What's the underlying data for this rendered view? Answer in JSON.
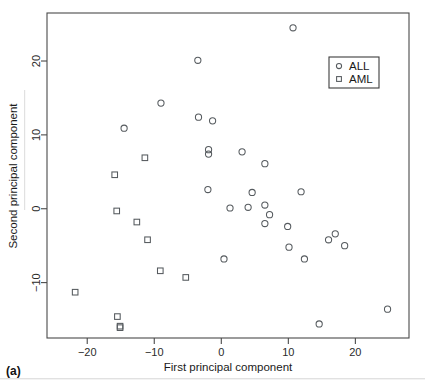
{
  "figure": {
    "panel_label": "(a)",
    "background_color": "#ffffff",
    "point_color": "#555a5e",
    "axis_color": "#4a4a4a"
  },
  "legend": {
    "position": "top-right",
    "entries": [
      {
        "label": "ALL",
        "marker": "circle-icon"
      },
      {
        "label": "AML",
        "marker": "square-icon"
      }
    ]
  },
  "chart_data": {
    "type": "scatter",
    "title": "",
    "subtitle": "",
    "xlabel": "First principal component",
    "ylabel": "Second principal component",
    "xlim": [
      -26,
      28
    ],
    "ylim": [
      -17.5,
      26.5
    ],
    "xticks": [
      -20,
      -10,
      0,
      10,
      20
    ],
    "yticks": [
      -10,
      0,
      10,
      20
    ],
    "xtick_labels": [
      "-20",
      "-10",
      "0",
      "10",
      "20"
    ],
    "ytick_labels": [
      "-10",
      "0",
      "10",
      "20"
    ],
    "grid": false,
    "legend_position": "top-right",
    "series": [
      {
        "name": "ALL",
        "marker": "circle",
        "points": [
          [
            10.7,
            24.5
          ],
          [
            -3.5,
            20.1
          ],
          [
            -9.0,
            14.3
          ],
          [
            -14.5,
            10.9
          ],
          [
            -3.4,
            12.4
          ],
          [
            -1.3,
            11.9
          ],
          [
            -1.9,
            8.0
          ],
          [
            -1.9,
            7.4
          ],
          [
            3.1,
            7.7
          ],
          [
            6.5,
            6.1
          ],
          [
            -2.0,
            2.6
          ],
          [
            4.6,
            2.2
          ],
          [
            11.9,
            2.3
          ],
          [
            1.3,
            0.1
          ],
          [
            4.0,
            0.2
          ],
          [
            6.5,
            0.5
          ],
          [
            7.2,
            -0.8
          ],
          [
            6.5,
            -2.0
          ],
          [
            9.9,
            -2.4
          ],
          [
            16.0,
            -4.2
          ],
          [
            17.0,
            -3.4
          ],
          [
            18.4,
            -5.0
          ],
          [
            10.1,
            -5.2
          ],
          [
            12.4,
            -6.8
          ],
          [
            0.4,
            -6.8
          ],
          [
            14.6,
            -15.6
          ],
          [
            24.8,
            -13.6
          ]
        ]
      },
      {
        "name": "AML",
        "marker": "square",
        "points": [
          [
            -11.4,
            6.9
          ],
          [
            -15.9,
            4.6
          ],
          [
            -15.6,
            -0.3
          ],
          [
            -12.6,
            -1.8
          ],
          [
            -11.0,
            -4.2
          ],
          [
            -9.1,
            -8.4
          ],
          [
            -5.3,
            -9.3
          ],
          [
            -21.8,
            -11.3
          ],
          [
            -15.5,
            -14.6
          ],
          [
            -15.1,
            -15.9
          ],
          [
            -15.1,
            -16.1
          ]
        ]
      }
    ]
  }
}
